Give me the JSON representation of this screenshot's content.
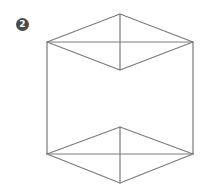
{
  "figure": {
    "label": "2",
    "line_color": "#7a7a7a",
    "vertices": {
      "top_apex": [
        120,
        14
      ],
      "top_left": [
        47,
        42
      ],
      "top_right": [
        193,
        42
      ],
      "top_inner": [
        120,
        70
      ],
      "bottom_inner": [
        120,
        127
      ],
      "bottom_left": [
        47,
        154
      ],
      "bottom_right": [
        193,
        154
      ],
      "bottom_apex": [
        120,
        183
      ]
    }
  }
}
